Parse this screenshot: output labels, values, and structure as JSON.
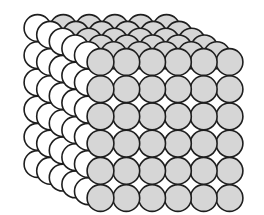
{
  "diagram": {
    "title": "Simple cubic packing of spheres",
    "structure": "6x6x6 cube of spheres",
    "grid": {
      "columns": 6,
      "rows": 6,
      "layers": 6
    },
    "geometry": {
      "front_origin_x": 100.5,
      "front_origin_y": 62,
      "spacing_x": 25.8,
      "spacing_y": 27.2,
      "radius": 13.4,
      "depth_dx": -12.6,
      "depth_dy": -6.8
    },
    "colors": {
      "front_face": "#d6d6d6",
      "top_face": "#d6d6d6",
      "side_face": "#ffffff",
      "outline": "#1e1e1e",
      "background": "#ffffff"
    }
  }
}
